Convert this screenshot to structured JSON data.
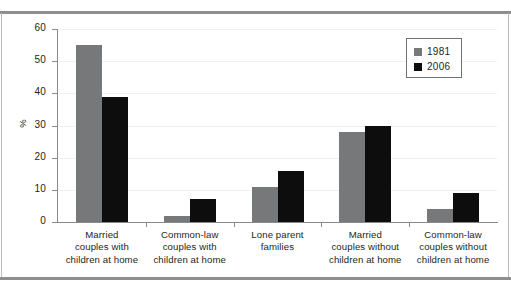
{
  "chart_data": {
    "type": "bar",
    "title": "",
    "subtitle": "",
    "xlabel": "",
    "ylabel": "%",
    "ylim": [
      0,
      60
    ],
    "yticks": [
      0,
      10,
      20,
      30,
      40,
      50,
      60
    ],
    "grid": true,
    "legend_position": "top-right",
    "categories": [
      [
        "Married",
        "couples with",
        "children at home"
      ],
      [
        "Common-law",
        "couples with",
        "children at home"
      ],
      [
        "Lone parent",
        "families"
      ],
      [
        "Married",
        "couples without",
        "children at home"
      ],
      [
        "Common-law",
        "couples without",
        "children at home"
      ]
    ],
    "series": [
      {
        "name": "1981",
        "color": "#76787a",
        "values": [
          55,
          2,
          11,
          28,
          4
        ]
      },
      {
        "name": "2006",
        "color": "#0d0d0d",
        "values": [
          39,
          7,
          16,
          30,
          9
        ]
      }
    ]
  },
  "legend": {
    "entries": [
      {
        "label": "1981",
        "swatch": "#76787a"
      },
      {
        "label": "2006",
        "swatch": "#0d0d0d"
      }
    ]
  },
  "colors": {
    "series_1981": "#76787a",
    "series_2006": "#0d0d0d",
    "axis": "#8a8a8a",
    "gridline": "#f0f0f0",
    "rule": "#8d8f91",
    "text": "#231f20"
  }
}
